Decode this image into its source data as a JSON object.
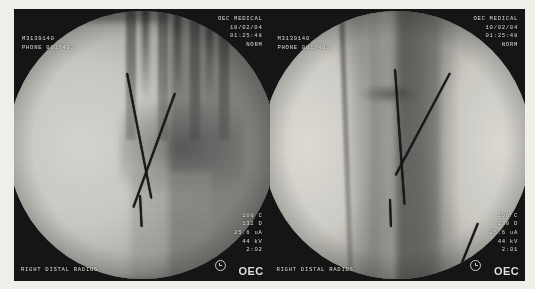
{
  "image": {
    "kind": "fluoroscopy-c-arm-dual-panel",
    "anatomy_caption": "RIGHT DISTAL RADIUS",
    "panel_count": 2
  },
  "panels": [
    {
      "id": "left",
      "view": "ap",
      "header": {
        "vendor": "OEC MEDICAL",
        "date": "10/02/04",
        "time": "01:25:48",
        "mode": "NORM"
      },
      "patient": {
        "line1": "M3139140",
        "line2": "PHONE 0017402"
      },
      "params": {
        "dose": "100 C",
        "rate": "132 D",
        "ma": "25.6 uA",
        "kv": "44 kV",
        "mag": "2:02"
      },
      "region": "RIGHT DISTAL RADIUS",
      "logo": "OEC",
      "clock_icon": "clock-icon",
      "hardware": "two crossed kirschner wires"
    },
    {
      "id": "right",
      "view": "lateral",
      "header": {
        "vendor": "OEC MEDICAL",
        "date": "10/02/04",
        "time": "01:25:48",
        "mode": "NORM"
      },
      "patient": {
        "line1": "M3139140",
        "line2": "PHONE 0017402"
      },
      "params": {
        "dose": "196 C",
        "rate": "130 D",
        "ma": "26.6 uA",
        "kv": "44 kV",
        "mag": "2:01"
      },
      "region": "RIGHT DISTAL RADIUS",
      "logo": "OEC",
      "clock_icon": "clock-icon",
      "hardware": "two kirschner wires"
    }
  ]
}
